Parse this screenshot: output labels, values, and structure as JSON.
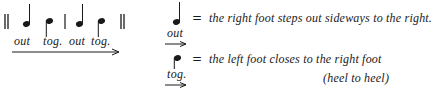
{
  "notation": {
    "barlines": [
      "double",
      "single",
      "double"
    ],
    "steps": [
      {
        "note": "quarter-note",
        "label": "out"
      },
      {
        "note": "tog-note",
        "label": "tog."
      },
      {
        "note": "quarter-note",
        "label": "out"
      },
      {
        "note": "tog-note",
        "label": "tog."
      }
    ],
    "direction": "right-arrow"
  },
  "legend": [
    {
      "note": "quarter-note",
      "label": "out",
      "equals": "=",
      "description": "the right foot steps out sideways to the right.",
      "direction": "right-arrow"
    },
    {
      "note": "tog-note",
      "label": "tog.",
      "equals": "=",
      "description": "the left foot closes to the right foot",
      "description_cont": "(heel to heel)",
      "direction": "right-arrow"
    }
  ],
  "colors": {
    "ink": "#1a1a1a",
    "background": "#ffffff"
  }
}
